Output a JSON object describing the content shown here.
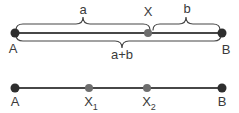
{
  "figure": {
    "top": {
      "labels": {
        "segment_a": "a",
        "point_x": "X",
        "segment_b": "b",
        "endpoint_a": "A",
        "endpoint_b": "B",
        "sum": "a+b"
      }
    },
    "bottom": {
      "labels": {
        "endpoint_a": "A",
        "point_x1": {
          "base": "X",
          "sub": "1"
        },
        "point_x2": {
          "base": "X",
          "sub": "2"
        },
        "endpoint_b": "B"
      }
    }
  },
  "colors": {
    "background": "#ffffff",
    "line": "#474747",
    "endpoint_dot": "#2e2e2e",
    "midpoint_dot": "#6e6e6e",
    "text": "#3a3a3a"
  }
}
